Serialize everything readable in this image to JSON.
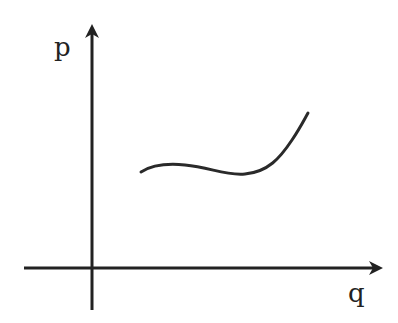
{
  "diagram": {
    "type": "axes-with-curve",
    "y_axis_label": "p",
    "x_axis_label": "q",
    "curve": {
      "description": "hand-drawn curve: slight rise, shallow dip, then steep rise",
      "path_points": [
        [
          141,
          172
        ],
        [
          165,
          164
        ],
        [
          200,
          167
        ],
        [
          240,
          175
        ],
        [
          270,
          165
        ],
        [
          295,
          135
        ],
        [
          308,
          113
        ]
      ]
    },
    "colors": {
      "stroke": "#222222",
      "background": "#ffffff"
    }
  }
}
